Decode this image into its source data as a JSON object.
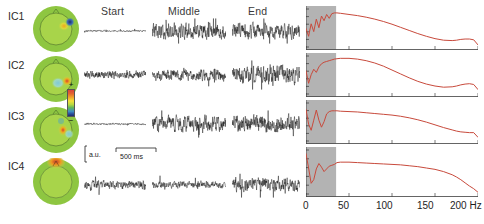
{
  "figure": {
    "columns": [
      {
        "key": "start",
        "label": "Start",
        "x": 110
      },
      {
        "key": "middle",
        "label": "Middle",
        "x": 180
      },
      {
        "key": "end",
        "label": "End",
        "x": 252
      }
    ],
    "components": [
      {
        "id": "IC1",
        "label": "IC1"
      },
      {
        "id": "IC2",
        "label": "IC2"
      },
      {
        "id": "IC3",
        "label": "IC3"
      },
      {
        "id": "IC4",
        "label": "IC4"
      }
    ]
  },
  "colorbar": {
    "plus_label": "+",
    "minus_label": "−",
    "colors": [
      "#d8443a",
      "#e2622f",
      "#efa22a",
      "#f4e03a",
      "#b8d840",
      "#5fb55a",
      "#3f8fc0",
      "#2b4d9c",
      "#1d2f6b"
    ],
    "head_fill": "#8ec641",
    "scalp_fill": "#a8d44a"
  },
  "scale_bar": {
    "vertical_label": "a.u.",
    "horizontal_label": "500 ms"
  },
  "spectra_axis": {
    "ticks": [
      {
        "value": 0,
        "label": "0"
      },
      {
        "value": 50,
        "label": "50"
      },
      {
        "value": 100,
        "label": "100"
      },
      {
        "value": 150,
        "label": "150"
      },
      {
        "value": 200,
        "label": "200 Hz"
      }
    ],
    "xlim": [
      0,
      200
    ],
    "shaded_band": [
      0,
      35
    ],
    "shade_color": "#b3b3b3",
    "curve_color": "#c84a3c",
    "unit": "Hz"
  },
  "chart_data": [
    {
      "type": "line",
      "title": "IC1 power spectrum",
      "xlabel": "Hz",
      "ylabel": "power (a.u.)",
      "xlim": [
        0,
        200
      ],
      "ylim": [
        0,
        1
      ],
      "grid": false,
      "legend": "none",
      "shaded_band": [
        0,
        35
      ],
      "x": [
        0,
        3,
        6,
        9,
        12,
        15,
        18,
        21,
        24,
        27,
        30,
        33,
        36,
        40,
        50,
        60,
        70,
        80,
        90,
        100,
        110,
        120,
        130,
        140,
        150,
        160,
        170,
        175,
        180,
        185,
        190,
        195,
        200
      ],
      "values": [
        0.5,
        0.3,
        0.62,
        0.42,
        0.74,
        0.52,
        0.82,
        0.7,
        0.86,
        0.76,
        0.88,
        0.9,
        0.9,
        0.89,
        0.86,
        0.83,
        0.79,
        0.74,
        0.68,
        0.61,
        0.53,
        0.45,
        0.37,
        0.3,
        0.24,
        0.2,
        0.19,
        0.2,
        0.22,
        0.23,
        0.23,
        0.21,
        0.08
      ]
    },
    {
      "type": "line",
      "title": "IC2 power spectrum",
      "xlabel": "Hz",
      "ylabel": "power (a.u.)",
      "xlim": [
        0,
        200
      ],
      "ylim": [
        0,
        1
      ],
      "grid": false,
      "legend": "none",
      "shaded_band": [
        0,
        35
      ],
      "x": [
        0,
        3,
        6,
        9,
        12,
        15,
        18,
        21,
        24,
        27,
        30,
        33,
        36,
        40,
        50,
        60,
        70,
        80,
        90,
        100,
        110,
        120,
        130,
        140,
        150,
        160,
        170,
        175,
        180,
        185,
        190,
        195,
        200
      ],
      "values": [
        0.62,
        0.3,
        0.52,
        0.66,
        0.58,
        0.72,
        0.8,
        0.84,
        0.86,
        0.88,
        0.9,
        0.92,
        0.93,
        0.94,
        0.94,
        0.92,
        0.88,
        0.82,
        0.74,
        0.64,
        0.54,
        0.44,
        0.35,
        0.28,
        0.23,
        0.2,
        0.21,
        0.23,
        0.26,
        0.28,
        0.29,
        0.27,
        0.14
      ]
    },
    {
      "type": "line",
      "title": "IC3 power spectrum",
      "xlabel": "Hz",
      "ylabel": "power (a.u.)",
      "xlim": [
        0,
        200
      ],
      "ylim": [
        0,
        1
      ],
      "grid": false,
      "legend": "none",
      "shaded_band": [
        0,
        35
      ],
      "x": [
        0,
        3,
        6,
        9,
        12,
        15,
        18,
        21,
        24,
        27,
        30,
        33,
        36,
        40,
        50,
        60,
        70,
        80,
        90,
        100,
        110,
        120,
        130,
        140,
        150,
        160,
        170,
        175,
        180,
        185,
        190,
        195,
        200
      ],
      "values": [
        0.84,
        0.46,
        0.3,
        0.56,
        0.82,
        0.56,
        0.38,
        0.52,
        0.72,
        0.78,
        0.8,
        0.8,
        0.8,
        0.79,
        0.78,
        0.77,
        0.75,
        0.73,
        0.71,
        0.69,
        0.66,
        0.62,
        0.57,
        0.51,
        0.44,
        0.37,
        0.31,
        0.28,
        0.26,
        0.25,
        0.24,
        0.24,
        0.12
      ]
    },
    {
      "type": "line",
      "title": "IC4 power spectrum",
      "xlabel": "Hz",
      "ylabel": "power (a.u.)",
      "xlim": [
        0,
        200
      ],
      "ylim": [
        0,
        1
      ],
      "grid": false,
      "legend": "none",
      "shaded_band": [
        0,
        35
      ],
      "x": [
        0,
        3,
        6,
        9,
        12,
        15,
        18,
        21,
        24,
        27,
        30,
        33,
        36,
        40,
        50,
        60,
        70,
        80,
        90,
        100,
        110,
        120,
        130,
        140,
        150,
        160,
        170,
        175,
        180,
        185,
        190,
        195,
        200
      ],
      "values": [
        0.92,
        0.6,
        0.26,
        0.34,
        0.58,
        0.7,
        0.62,
        0.52,
        0.58,
        0.64,
        0.66,
        0.68,
        0.72,
        0.73,
        0.73,
        0.72,
        0.71,
        0.7,
        0.69,
        0.68,
        0.67,
        0.65,
        0.63,
        0.6,
        0.57,
        0.52,
        0.45,
        0.4,
        0.34,
        0.27,
        0.2,
        0.14,
        0.06
      ]
    }
  ],
  "traces": {
    "IC1": {
      "start_amp": 0.1,
      "middle_amp": 0.95,
      "end_amp": 0.95,
      "seed": 11
    },
    "IC2": {
      "start_amp": 0.42,
      "middle_amp": 0.62,
      "end_amp": 1.0,
      "seed": 23
    },
    "IC3": {
      "start_amp": 0.1,
      "middle_amp": 0.9,
      "end_amp": 1.0,
      "seed": 37
    },
    "IC4": {
      "start_amp": 0.55,
      "middle_amp": 0.45,
      "end_amp": 0.85,
      "seed": 53
    }
  },
  "topographies": {
    "IC1": {
      "blob": "right-temporal-dipole",
      "positive": "#e8a020",
      "negative": "#24408e"
    },
    "IC2": {
      "blob": "right-temporal-dipole",
      "positive": "#d4452f",
      "negative": "#8fd4d8"
    },
    "IC3": {
      "blob": "right-central-dipole",
      "positive": "#d4452f",
      "negative": "#7fc9d8"
    },
    "IC4": {
      "blob": "frontal-positive",
      "positive": "#c8392b",
      "negative": "#a8d44a"
    }
  }
}
